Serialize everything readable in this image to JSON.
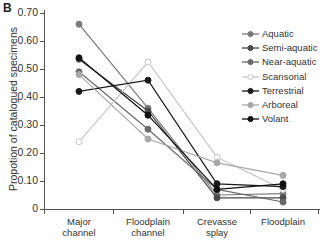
{
  "panel_label": "B",
  "chart_data": {
    "type": "line",
    "title": "",
    "xlabel": "",
    "ylabel": "Propotion of catalogued specimens",
    "ylim": [
      0,
      0.7
    ],
    "yticks": [
      "0",
      "0.10",
      "0.20",
      "0.30",
      "0.40",
      "0.50",
      "0.60",
      "0.70"
    ],
    "categories": [
      "Major channel",
      "Floodplain channel",
      "Crevasse splay",
      "Floodplain"
    ],
    "category_lines": [
      [
        "Major",
        "channel"
      ],
      [
        "Floodplain",
        "channel"
      ],
      [
        "Crevasse",
        "splay"
      ],
      [
        "Floodplain",
        ""
      ]
    ],
    "grid": false,
    "legend_position": "upper right",
    "series": [
      {
        "name": "Aquatic",
        "color": "#7a7a7a",
        "marker_fill": "#7a7a7a",
        "values": [
          0.66,
          0.36,
          0.05,
          0.055
        ]
      },
      {
        "name": "Semi-aquatic",
        "color": "#4a4a4a",
        "marker_fill": "#4a4a4a",
        "values": [
          0.535,
          0.35,
          0.04,
          0.04
        ]
      },
      {
        "name": "Near-aquatic",
        "color": "#6a6a6a",
        "marker_fill": "#6a6a6a",
        "values": [
          0.49,
          0.285,
          0.07,
          0.025
        ]
      },
      {
        "name": "Scansorial",
        "color": "#c8c8c8",
        "marker_fill": "#ffffff",
        "values": [
          0.24,
          0.525,
          0.185,
          0.07
        ]
      },
      {
        "name": "Terrestrial",
        "color": "#1a1a1a",
        "marker_fill": "#1a1a1a",
        "values": [
          0.42,
          0.46,
          0.09,
          0.08
        ]
      },
      {
        "name": "Arboreal",
        "color": "#a8a8a8",
        "marker_fill": "#a8a8a8",
        "values": [
          0.48,
          0.25,
          0.165,
          0.12
        ]
      },
      {
        "name": "Volant",
        "color": "#111111",
        "marker_fill": "#111111",
        "values": [
          0.54,
          0.335,
          0.07,
          0.09
        ]
      }
    ]
  }
}
